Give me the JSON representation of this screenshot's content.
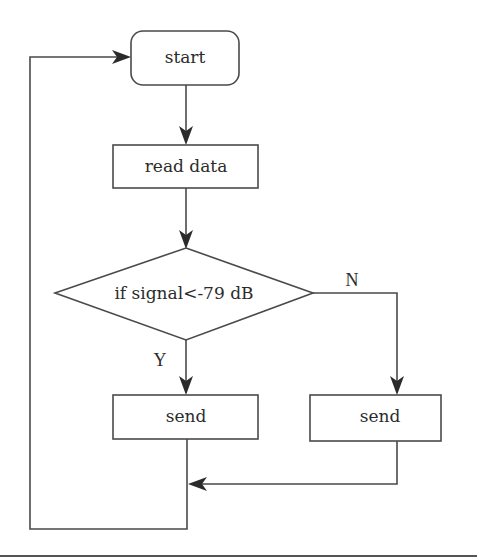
{
  "diagram": {
    "type": "flowchart",
    "nodes": {
      "start": {
        "label": "start",
        "shape": "rounded-rectangle"
      },
      "read_data": {
        "label": "read data",
        "shape": "rectangle"
      },
      "decision": {
        "label": "if signal<-79 dB",
        "shape": "diamond"
      },
      "send_yes": {
        "label": "send",
        "shape": "rectangle"
      },
      "send_no": {
        "label": "send",
        "shape": "rectangle"
      }
    },
    "edge_labels": {
      "yes": "Y",
      "no": "N"
    },
    "edges": [
      {
        "from": "start",
        "to": "read_data"
      },
      {
        "from": "read_data",
        "to": "decision"
      },
      {
        "from": "decision",
        "to": "send_yes",
        "label": "Y"
      },
      {
        "from": "decision",
        "to": "send_no",
        "label": "N"
      },
      {
        "from": "send_no",
        "to": "merge"
      },
      {
        "from": "send_yes",
        "to": "start",
        "note": "loop back"
      }
    ],
    "colors": {
      "stroke": "#4a4a4a",
      "text": "#2b2b2b",
      "background": "#ffffff"
    }
  }
}
